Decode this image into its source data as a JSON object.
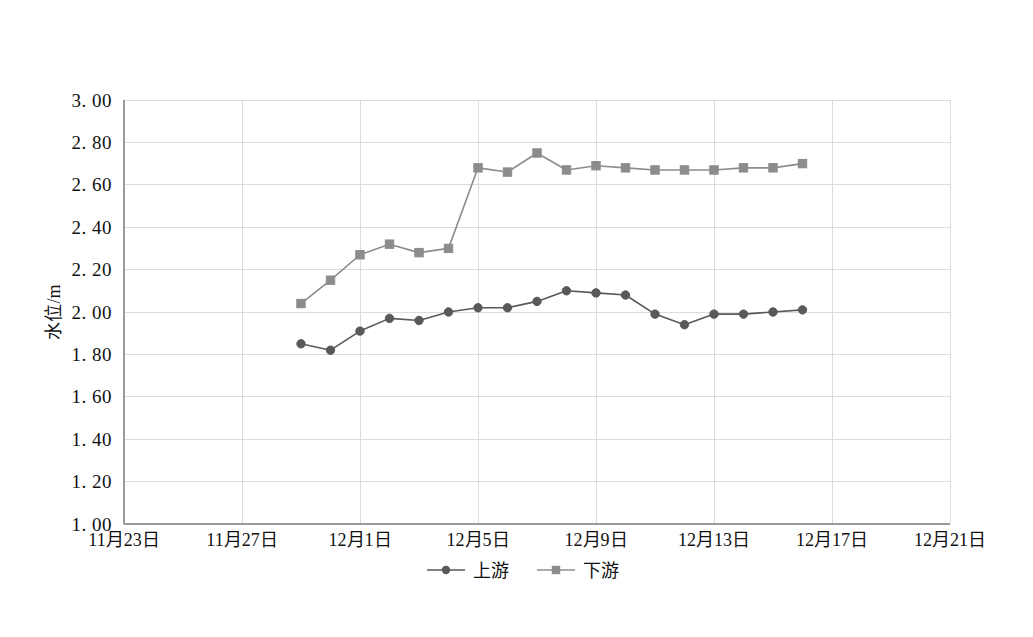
{
  "chart_data": {
    "type": "line",
    "title": "",
    "xlabel": "",
    "ylabel": "水位/m",
    "ylim": [
      1.0,
      3.0
    ],
    "ytick_step": 0.2,
    "ytick_labels": [
      "1. 00",
      "1. 20",
      "1. 40",
      "1. 60",
      "1. 80",
      "2. 00",
      "2. 20",
      "2. 40",
      "2. 60",
      "2. 80",
      "3. 00"
    ],
    "ytick_values": [
      1.0,
      1.2,
      1.4,
      1.6,
      1.8,
      2.0,
      2.2,
      2.4,
      2.6,
      2.8,
      3.0
    ],
    "xtick_labels": [
      "11月23日",
      "11月27日",
      "12月1日",
      "12月5日",
      "12月9日",
      "12月13日",
      "12月17日",
      "12月21日"
    ],
    "xtick_values": [
      0,
      4,
      8,
      12,
      16,
      20,
      24,
      28
    ],
    "xlim": [
      0,
      28
    ],
    "grid": true,
    "legend_position": "bottom",
    "x_axis_unit": "day index from 11月23日",
    "series": [
      {
        "name": "上游",
        "color": "#595959",
        "marker": "circle",
        "x": [
          6,
          7,
          8,
          9,
          10,
          11,
          12,
          13,
          14,
          15,
          16,
          17,
          18,
          19,
          20,
          21,
          22,
          23
        ],
        "values": [
          1.85,
          1.82,
          1.91,
          1.97,
          1.96,
          2.0,
          2.02,
          2.02,
          2.05,
          2.1,
          2.09,
          2.08,
          1.99,
          1.94,
          1.99,
          1.99,
          2.0,
          2.01
        ]
      },
      {
        "name": "下游",
        "color": "#8c8c8c",
        "marker": "square",
        "x": [
          6,
          7,
          8,
          9,
          10,
          11,
          12,
          13,
          14,
          15,
          16,
          17,
          18,
          19,
          20,
          21,
          22,
          23
        ],
        "values": [
          2.04,
          2.15,
          2.27,
          2.32,
          2.28,
          2.3,
          2.68,
          2.66,
          2.75,
          2.67,
          2.69,
          2.68,
          2.67,
          2.67,
          2.67,
          2.68,
          2.68,
          2.7
        ]
      }
    ]
  },
  "legend": {
    "items": [
      {
        "label": "上游",
        "color": "#595959",
        "marker": "circle"
      },
      {
        "label": "下游",
        "color": "#8c8c8c",
        "marker": "square"
      }
    ]
  },
  "colors": {
    "upstream": "#595959",
    "downstream": "#8c8c8c",
    "grid": "#dcdcdc",
    "axis": "#9a9a9a",
    "text": "#111111",
    "background": "#ffffff"
  }
}
